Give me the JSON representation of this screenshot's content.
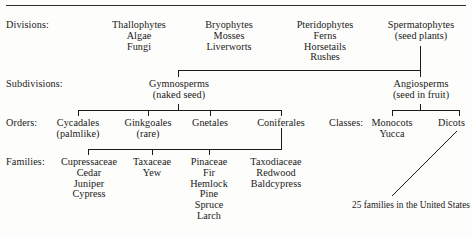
{
  "diagram": {
    "line_color": "#1a1a1a",
    "background": "#fdfdfb"
  },
  "row_labels": {
    "divisions": "Divisions:",
    "subdivisions": "Subdivisions:",
    "orders": "Orders:",
    "families": "Families:",
    "classes": "Classes:"
  },
  "divisions": [
    {
      "name": "Thallophytes",
      "members": [
        "Algae",
        "Fungi"
      ]
    },
    {
      "name": "Bryophytes",
      "members": [
        "Mosses",
        "Liverworts"
      ]
    },
    {
      "name": "Pteridophytes",
      "members": [
        "Ferns",
        "Horsetails",
        "Rushes"
      ]
    },
    {
      "name": "Spermatophytes",
      "members": [
        "(seed plants)"
      ]
    }
  ],
  "subdivisions": [
    {
      "name": "Gymnosperms",
      "members": [
        "(naked seed)"
      ]
    },
    {
      "name": "Angiosperms",
      "members": [
        "(seed in fruit)"
      ]
    }
  ],
  "orders": [
    {
      "name": "Cycadales",
      "members": [
        "(palmlike)"
      ]
    },
    {
      "name": "Ginkgoales",
      "members": [
        "(rare)"
      ]
    },
    {
      "name": "Gnetales",
      "members": []
    },
    {
      "name": "Coniferales",
      "members": []
    }
  ],
  "classes": [
    {
      "name": "Monocots",
      "members": [
        "Yucca"
      ]
    },
    {
      "name": "Dicots",
      "members": []
    }
  ],
  "families": [
    {
      "name": "Cupressaceae",
      "members": [
        "Cedar",
        "Juniper",
        "Cypress"
      ]
    },
    {
      "name": "Taxaceae",
      "members": [
        "Yew"
      ]
    },
    {
      "name": "Pinaceae",
      "members": [
        "Fir",
        "Hemlock",
        "Pine",
        "Spruce",
        "Larch"
      ]
    },
    {
      "name": "Taxodiaceae",
      "members": [
        "Redwood",
        "Baldcypress"
      ]
    }
  ],
  "annotation": {
    "line1": "25 families in the",
    "line2": "United States"
  }
}
